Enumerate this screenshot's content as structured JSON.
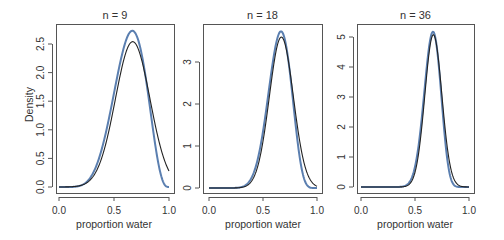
{
  "figure": {
    "ylabel": "Density",
    "xlabel": "proportion water",
    "colors": {
      "exact": "#5b7fb0",
      "approx": "#222222",
      "frame": "#555555",
      "text": "#333333"
    }
  },
  "chart_data": [
    {
      "type": "line",
      "title": "n = 9",
      "xlabel": "proportion water",
      "ylabel": "Density",
      "xlim": [
        0,
        1
      ],
      "ylim": [
        0,
        2.75
      ],
      "xticks": [
        "0.0",
        "0.5",
        "1.0"
      ],
      "yticks": [
        "0.0",
        "0.5",
        "1.0",
        "1.5",
        "2.0",
        "2.5"
      ],
      "ytick_values": [
        0,
        0.5,
        1.0,
        1.5,
        2.0,
        2.5
      ],
      "grid": false,
      "series": [
        {
          "name": "exact posterior (blue)",
          "dist": "beta",
          "a": 7,
          "b": 4,
          "color": "#5b7fb0",
          "peak": 2.73,
          "peak_x": 0.67
        },
        {
          "name": "quadratic approximation (black)",
          "dist": "normal",
          "mean": 0.67,
          "sd": 0.157,
          "color": "#222222",
          "peak": 2.54,
          "peak_x": 0.67
        }
      ]
    },
    {
      "type": "line",
      "title": "n = 18",
      "xlabel": "proportion water",
      "ylabel": "",
      "xlim": [
        0,
        1
      ],
      "ylim": [
        0,
        3.75
      ],
      "xticks": [
        "0.0",
        "0.5",
        "1.0"
      ],
      "yticks": [
        "0",
        "1",
        "2",
        "3"
      ],
      "ytick_values": [
        0,
        1,
        2,
        3
      ],
      "grid": false,
      "series": [
        {
          "name": "exact posterior (blue)",
          "dist": "beta",
          "a": 13,
          "b": 7,
          "color": "#5b7fb0",
          "peak": 3.7,
          "peak_x": 0.67
        },
        {
          "name": "quadratic approximation (black)",
          "dist": "normal",
          "mean": 0.67,
          "sd": 0.111,
          "color": "#222222",
          "peak": 3.59,
          "peak_x": 0.67
        }
      ]
    },
    {
      "type": "line",
      "title": "n = 36",
      "xlabel": "proportion water",
      "ylabel": "",
      "xlim": [
        0,
        1
      ],
      "ylim": [
        0,
        5.2
      ],
      "xticks": [
        "0.0",
        "0.5",
        "1.0"
      ],
      "yticks": [
        "0",
        "1",
        "2",
        "3",
        "4",
        "5"
      ],
      "ytick_values": [
        0,
        1,
        2,
        3,
        4,
        5
      ],
      "grid": false,
      "series": [
        {
          "name": "exact posterior (blue)",
          "dist": "beta",
          "a": 25,
          "b": 13,
          "color": "#5b7fb0",
          "peak": 5.15,
          "peak_x": 0.67
        },
        {
          "name": "quadratic approximation (black)",
          "dist": "normal",
          "mean": 0.67,
          "sd": 0.0786,
          "color": "#222222",
          "peak": 5.08,
          "peak_x": 0.67
        }
      ]
    }
  ],
  "layout": {
    "panels": [
      {
        "left": 56,
        "right": 174,
        "top": 24,
        "bottom": 193,
        "x0px": 59,
        "x1px": 169,
        "y0px": 187,
        "ytop_val": 2.5,
        "ytop_px": 44
      },
      {
        "left": 203,
        "right": 322,
        "top": 24,
        "bottom": 193,
        "x0px": 209,
        "x1px": 317,
        "y0px": 188,
        "ytop_val": 3,
        "ytop_px": 62
      },
      {
        "left": 357,
        "right": 474,
        "top": 24,
        "bottom": 193,
        "x0px": 361,
        "x1px": 469,
        "y0px": 187,
        "ytop_val": 5,
        "ytop_px": 37
      }
    ]
  }
}
